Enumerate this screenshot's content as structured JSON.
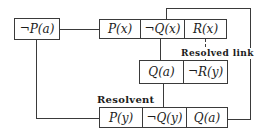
{
  "colors": {
    "bg": "#ffffff",
    "line": "#3a3a3a",
    "text": "#1c1c1c"
  },
  "labels": {
    "resolvent": "Resolvent",
    "resolved_link": "Resolved link"
  },
  "clauses": {
    "unit": {
      "literals": [
        "¬P(a)"
      ]
    },
    "top": {
      "literals": [
        "P(x)",
        "¬Q(x)",
        "R(x)"
      ]
    },
    "middle": {
      "literals": [
        "Q(a)",
        "¬R(y)"
      ]
    },
    "resolvent": {
      "literals": [
        "P(y)",
        "¬Q(y)",
        "Q(a)"
      ]
    }
  },
  "links": [
    {
      "from": "¬P(a)",
      "to": "P(x)",
      "style": "solid"
    },
    {
      "from": "¬P(a)",
      "to": "P(y)",
      "style": "solid"
    },
    {
      "from": "¬Q(x)",
      "to": "Q(a)",
      "style": "solid"
    },
    {
      "from": "R(x)",
      "to": "¬R(y)",
      "style": "dashed",
      "label": "Resolved link"
    },
    {
      "from": "Q(a)",
      "to": "¬Q(y)",
      "style": "solid"
    },
    {
      "from": "Q(a) (resolvent)",
      "to": "¬Q(x)",
      "style": "solid"
    }
  ]
}
